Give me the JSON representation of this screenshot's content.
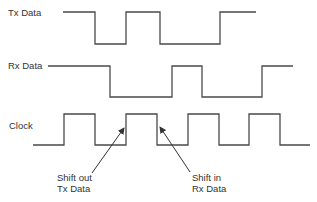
{
  "diagram": {
    "type": "timing-diagram",
    "signals": [
      {
        "name": "Tx Data",
        "points": [
          [
            63,
            12
          ],
          [
            95,
            12
          ],
          [
            95,
            44
          ],
          [
            126,
            44
          ],
          [
            126,
            12
          ],
          [
            160,
            12
          ],
          [
            160,
            44
          ],
          [
            220,
            44
          ],
          [
            220,
            12
          ],
          [
            256,
            12
          ]
        ]
      },
      {
        "name": "Rx Data",
        "points": [
          [
            48,
            66
          ],
          [
            110,
            66
          ],
          [
            110,
            97
          ],
          [
            172,
            97
          ],
          [
            172,
            66
          ],
          [
            202,
            66
          ],
          [
            202,
            97
          ],
          [
            262,
            97
          ],
          [
            262,
            66
          ],
          [
            293,
            66
          ]
        ]
      },
      {
        "name": "Clock",
        "points": [
          [
            33,
            145
          ],
          [
            64,
            145
          ],
          [
            64,
            114
          ],
          [
            95,
            114
          ],
          [
            95,
            145
          ],
          [
            126,
            145
          ],
          [
            126,
            114
          ],
          [
            157,
            114
          ],
          [
            157,
            145
          ],
          [
            188,
            145
          ],
          [
            188,
            114
          ],
          [
            219,
            114
          ],
          [
            219,
            145
          ],
          [
            249,
            145
          ],
          [
            249,
            114
          ],
          [
            280,
            114
          ],
          [
            280,
            145
          ],
          [
            310,
            145
          ]
        ]
      }
    ],
    "annotations": [
      {
        "id": "shift-out",
        "lines": [
          "Shift out",
          "Tx Data"
        ],
        "arrow_from": [
          92,
          173
        ],
        "arrow_to": [
          124,
          128
        ]
      },
      {
        "id": "shift-in",
        "lines": [
          "Shift in",
          "Rx Data"
        ],
        "arrow_from": [
          190,
          172
        ],
        "arrow_to": [
          160,
          127
        ]
      }
    ],
    "line_color": "#4a4a4a",
    "text_color": "#333333"
  },
  "labels": {
    "tx": "Tx Data",
    "rx": "Rx Data",
    "clock": "Clock",
    "shift_out_1": "Shift out",
    "shift_out_2": "Tx Data",
    "shift_in_1": "Shift in",
    "shift_in_2": "Rx Data"
  }
}
